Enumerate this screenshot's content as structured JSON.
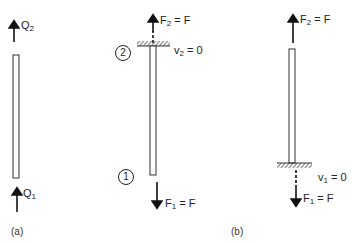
{
  "figure": {
    "panel_a": {
      "caption": "(a)",
      "top_force": {
        "symbol": "Q",
        "subscript": "2"
      },
      "bottom_force": {
        "symbol": "Q",
        "subscript": "1"
      }
    },
    "panel_b_left": {
      "node_top": "2",
      "node_bottom": "1",
      "top_force": {
        "symbol": "F",
        "subscript": "2",
        "rhs": " = F"
      },
      "top_support": {
        "symbol": "v",
        "subscript": "2",
        "rhs": " = 0"
      },
      "bottom_force": {
        "symbol": "F",
        "subscript": "1",
        "rhs": " = F"
      }
    },
    "panel_b_right": {
      "caption": "(b)",
      "top_force": {
        "symbol": "F",
        "subscript": "2",
        "rhs": " = F"
      },
      "bottom_support": {
        "symbol": "v",
        "subscript": "1",
        "rhs": " = 0"
      },
      "bottom_force": {
        "symbol": "F",
        "subscript": "1",
        "rhs": " = F"
      }
    }
  }
}
